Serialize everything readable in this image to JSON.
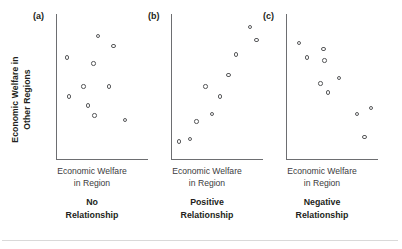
{
  "figure": {
    "axis_titles": {
      "y_line1": "Economic Welfare in",
      "y_line2": "Other Regions",
      "x_line1": "Economic Welfare",
      "x_line2": "in Region"
    },
    "colors": {
      "axis": "#6d6e71",
      "marker_stroke": "#58595b",
      "text": "#231f20",
      "background": "#ffffff",
      "rule": "#d9d9d9"
    }
  },
  "panels": [
    {
      "tag": "(a)",
      "caption_line1": "No",
      "caption_line2": "Relationship",
      "xlabel_line1": "Economic Welfare",
      "xlabel_line2": "in Region"
    },
    {
      "tag": "(b)",
      "caption_line1": "Positive",
      "caption_line2": "Relationship",
      "xlabel_line1": "Economic Welfare",
      "xlabel_line2": "in Region"
    },
    {
      "tag": "(c)",
      "caption_line1": "Negative",
      "caption_line2": "Relationship",
      "xlabel_line1": "Economic Welfare",
      "xlabel_line2": "in Region"
    }
  ],
  "chart_data": [
    {
      "type": "scatter",
      "title": "No Relationship",
      "panel": "(a)",
      "xlabel": "Economic Welfare in Region",
      "ylabel": "Economic Welfare in Other Regions",
      "xlim": [
        0,
        100
      ],
      "ylim": [
        0,
        100
      ],
      "grid": false,
      "legend": "none",
      "points": [
        {
          "x": 11,
          "y": 70
        },
        {
          "x": 45,
          "y": 85
        },
        {
          "x": 62,
          "y": 78
        },
        {
          "x": 40,
          "y": 66
        },
        {
          "x": 29,
          "y": 50
        },
        {
          "x": 13,
          "y": 43
        },
        {
          "x": 34,
          "y": 37
        },
        {
          "x": 57,
          "y": 50
        },
        {
          "x": 41,
          "y": 30
        },
        {
          "x": 75,
          "y": 27
        }
      ]
    },
    {
      "type": "scatter",
      "title": "Positive Relationship",
      "panel": "(b)",
      "xlabel": "Economic Welfare in Region",
      "ylabel": "Economic Welfare in Other Regions",
      "xlim": [
        0,
        100
      ],
      "ylim": [
        0,
        100
      ],
      "grid": false,
      "legend": "none",
      "points": [
        {
          "x": 8,
          "y": 12
        },
        {
          "x": 20,
          "y": 14
        },
        {
          "x": 27,
          "y": 26
        },
        {
          "x": 44,
          "y": 31
        },
        {
          "x": 37,
          "y": 50
        },
        {
          "x": 53,
          "y": 43
        },
        {
          "x": 62,
          "y": 58
        },
        {
          "x": 70,
          "y": 72
        },
        {
          "x": 86,
          "y": 91
        },
        {
          "x": 93,
          "y": 82
        }
      ]
    },
    {
      "type": "scatter",
      "title": "Negative Relationship",
      "panel": "(c)",
      "xlabel": "Economic Welfare in Region",
      "ylabel": "Economic Welfare in Other Regions",
      "xlim": [
        0,
        100
      ],
      "ylim": [
        0,
        100
      ],
      "grid": false,
      "legend": "none",
      "points": [
        {
          "x": 13,
          "y": 80
        },
        {
          "x": 22,
          "y": 70
        },
        {
          "x": 40,
          "y": 76
        },
        {
          "x": 41,
          "y": 68
        },
        {
          "x": 37,
          "y": 52
        },
        {
          "x": 45,
          "y": 46
        },
        {
          "x": 57,
          "y": 56
        },
        {
          "x": 77,
          "y": 31
        },
        {
          "x": 92,
          "y": 35
        },
        {
          "x": 85,
          "y": 15
        }
      ]
    }
  ]
}
